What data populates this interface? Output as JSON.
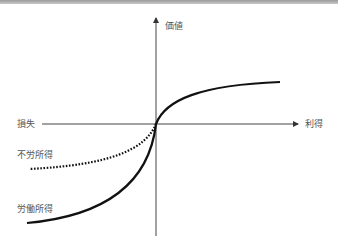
{
  "diagram": {
    "title": "",
    "axes": {
      "y_label": "価値",
      "x_positive_label": "利得",
      "x_negative_label": "損失"
    },
    "curves": [
      {
        "name": "労働所得",
        "style": "solid",
        "region": "gain and loss"
      },
      {
        "name": "不労所得",
        "style": "dotted",
        "region": "loss"
      }
    ],
    "labels": {
      "unearned_income": "不労所得",
      "earned_income": "労働所得"
    },
    "colors": {
      "axis": "#444444",
      "curve": "#111111",
      "label": "#555555",
      "top_border": "#9a9a9a"
    }
  }
}
